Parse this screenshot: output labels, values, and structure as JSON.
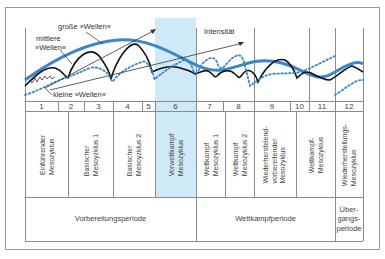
{
  "diagram": {
    "labels": {
      "large_waves": "große »Wellen«",
      "medium_waves_line1": "mittlere",
      "medium_waves_line2": "»Wellen«",
      "small_waves": "kleine »Wellen«",
      "intensity": "Intensität"
    },
    "numbers": [
      "1",
      "2",
      "3",
      "4",
      "5",
      "6",
      "7",
      "8",
      "9",
      "10",
      "11",
      "12"
    ],
    "mesocycles": [
      {
        "line1": "Einführender",
        "line2": "Mesozyklus",
        "line3": ""
      },
      {
        "line1": "Basischer",
        "line2": "Mesoyzklus 1",
        "line3": ""
      },
      {
        "line1": "Basischer",
        "line2": "Mesoyzklus 2",
        "line3": ""
      },
      {
        "line1": "Vorwettkampf",
        "line2": "Mesozyklus",
        "line3": ""
      },
      {
        "line1": "Wettkampf",
        "line2": "Mesozyklus 1",
        "line3": ""
      },
      {
        "line1": "Wettkampf",
        "line2": "Mesozyklus 2",
        "line3": ""
      },
      {
        "line1": "Wiederherstelend-",
        "line2": "vorbereitender",
        "line3": "Mesozyklus"
      },
      {
        "line1": "Wettkampf-",
        "line2": "Mesozyklus",
        "line3": ""
      },
      {
        "line1": "Wiederherstellungs-",
        "line2": "Mesozyklus",
        "line3": ""
      }
    ],
    "periods": [
      {
        "label": "Vorbereitungsperiode"
      },
      {
        "label": "Wettkampfperiode"
      },
      {
        "line1": "Über-",
        "line2": "gangs-",
        "line3": "periode"
      }
    ],
    "colors": {
      "highlight": "#cfeaf6",
      "large_wave": "#3a86c8",
      "medium_wave": "#111111",
      "small_wave": "#3a86c8",
      "grid": "#8c8c8c"
    }
  }
}
